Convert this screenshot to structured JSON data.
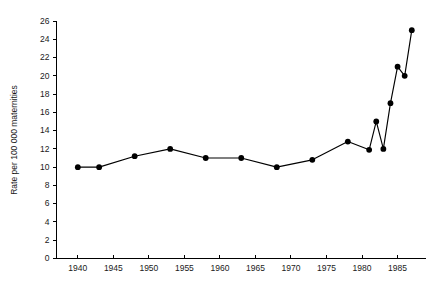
{
  "chart_data": {
    "type": "line",
    "title": "",
    "xlabel": "",
    "ylabel": "Rate per 100 000 maternities",
    "xlim": [
      1937,
      1989
    ],
    "ylim": [
      0,
      26
    ],
    "grid": false,
    "legend": false,
    "marker": "filled-circle",
    "xticks": [
      1940,
      1945,
      1950,
      1955,
      1960,
      1965,
      1970,
      1975,
      1980,
      1985
    ],
    "xtick_labels": [
      "1940",
      "1945",
      "1950",
      "1955",
      "1960",
      "1965",
      "1970",
      "1975",
      "1980",
      "1985"
    ],
    "yticks": [
      0,
      2,
      4,
      6,
      8,
      10,
      12,
      14,
      16,
      18,
      20,
      22,
      24,
      26
    ],
    "ytick_labels": [
      "0",
      "2",
      "4",
      "6",
      "8",
      "10",
      "12",
      "14",
      "16",
      "18",
      "20",
      "22",
      "24",
      "26"
    ],
    "x": [
      1940,
      1943,
      1948,
      1953,
      1958,
      1963,
      1968,
      1973,
      1978,
      1981,
      1982,
      1983,
      1984,
      1985,
      1986,
      1987
    ],
    "values": [
      10.0,
      10.0,
      11.2,
      12.0,
      11.0,
      11.0,
      10.0,
      10.8,
      12.8,
      11.9,
      15.0,
      12.0,
      17.0,
      21.0,
      20.0,
      25.0
    ],
    "series": [
      {
        "name": "Rate per 100 000 maternities",
        "color": "#000000",
        "values": [
          10.0,
          10.0,
          11.2,
          12.0,
          11.0,
          11.0,
          10.0,
          10.8,
          12.8,
          11.9,
          15.0,
          12.0,
          17.0,
          21.0,
          20.0,
          25.0
        ]
      }
    ],
    "annotations": []
  },
  "figure": {
    "background_color": "#ffffff",
    "axis_color": "#000000",
    "text_color": "#1a1a1a"
  }
}
